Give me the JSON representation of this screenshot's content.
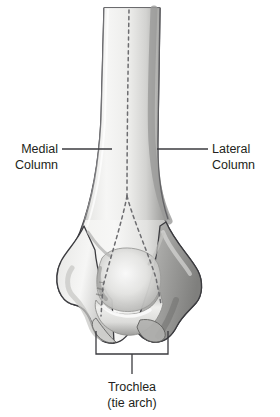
{
  "figure": {
    "background_color": "#ffffff",
    "line_color": "#3b3b3f",
    "text_color": "#231f20"
  },
  "labels": {
    "medial": {
      "line1": "Medial",
      "line2": "Column"
    },
    "lateral": {
      "line1": "Lateral",
      "line2": "Column"
    },
    "trochlea": {
      "line1": "Trochlea",
      "line2": "(tie arch)"
    }
  },
  "bone": {
    "name": "distal-humerus",
    "fill_light": "#f4f4f2",
    "fill_mid": "#d8d8d6",
    "fill_dark": "#9b9b99",
    "fill_shadow": "#7e7e7d",
    "outline": "#3b3b3f",
    "dashed_axis_color": "#6d6d70"
  }
}
